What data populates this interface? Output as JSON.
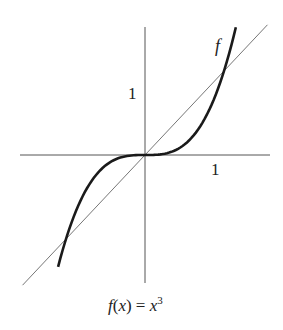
{
  "diagram": {
    "function_label": "f",
    "x_tick_label": "1",
    "y_tick_label": "1",
    "caption": {
      "f": "f",
      "open_paren": "(",
      "x": "x",
      "close_paren_eq": ") = ",
      "rhs_x": "x",
      "exponent": "3"
    },
    "caption_text": "f(x) = x³",
    "curve": {
      "type": "cubic",
      "expression": "y = x^3",
      "x_range": [
        -1.1,
        1.15
      ]
    },
    "reference_line": {
      "expression": "y = x",
      "x_range": [
        -1.55,
        1.55
      ]
    },
    "intersections": [
      [
        -1,
        -1
      ],
      [
        0,
        0
      ],
      [
        1,
        1
      ]
    ],
    "colors": {
      "curve": "#1a1a1a",
      "axis": "#555555",
      "reference_line": "#666666"
    }
  },
  "layout": {
    "origin": [
      145,
      155
    ],
    "x_scale": 79,
    "y_scale": 84,
    "x_axis": [
      20,
      270
    ],
    "y_axis": [
      27,
      283
    ]
  }
}
